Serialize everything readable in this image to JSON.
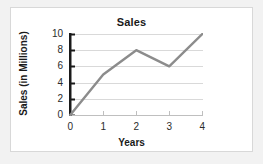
{
  "chart_data": {
    "type": "line",
    "title": "Sales",
    "xlabel": "Years",
    "ylabel": "Sales (in Millions)",
    "x": [
      0,
      1,
      2,
      3,
      4
    ],
    "values": [
      0,
      5,
      8,
      6,
      10
    ],
    "xtick_labels": [
      "0",
      "1",
      "2",
      "3",
      "4"
    ],
    "ytick_labels": [
      "0",
      "2",
      "4",
      "6",
      "8",
      "10"
    ],
    "yticks": [
      0,
      2,
      4,
      6,
      8,
      10
    ],
    "xlim": [
      0,
      4
    ],
    "ylim": [
      0,
      10
    ],
    "grid": "horizontal",
    "legend": "none",
    "series_color": "#8c8c8c",
    "gridline_color": "#d9d9d9",
    "yaxis_color": "#1a1a1a",
    "xaxis_color": "#bfbfbf",
    "panel_background": "#ffffff",
    "figure_background": "#f2f2f2"
  }
}
